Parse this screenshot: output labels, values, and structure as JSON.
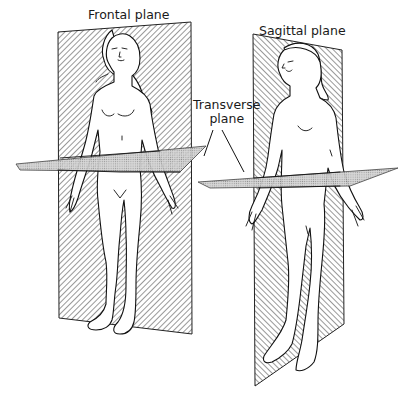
{
  "figure": {
    "type": "anatomical-planes-diagram",
    "labels": {
      "frontal": "Frontal plane",
      "sagittal": "Sagittal plane",
      "transverse_line1": "Transverse",
      "transverse_line2": "plane"
    },
    "figures": [
      {
        "id": "left-figure",
        "view": "anterior",
        "planes": [
          "frontal",
          "transverse"
        ]
      },
      {
        "id": "right-figure",
        "view": "three-quarter",
        "planes": [
          "sagittal",
          "transverse"
        ]
      }
    ],
    "colors": {
      "vertical_plane_hatch": "#555555",
      "transverse_plane_fill": "#c8c8c8",
      "outline": "#111111",
      "background": "#ffffff"
    }
  }
}
